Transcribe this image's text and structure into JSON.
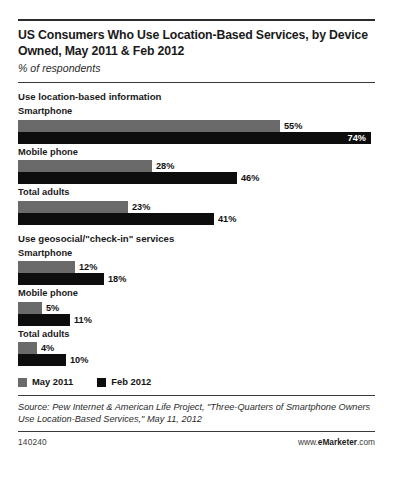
{
  "title": "US Consumers Who Use Location-Based Services, by Device Owned, May 2011 & Feb 2012",
  "subtitle": "% of respondents",
  "legend": {
    "series1": "May 2011",
    "series2": "Feb 2012"
  },
  "source": "Source: Pew Internet & American Life Project, \"Three-Quarters of Smartphone Owners Use Location-Based Services,\" May 11, 2012",
  "footer": {
    "id": "140240",
    "brand_prefix": "www.",
    "brand_name": "eMarketer",
    "brand_suffix": ".com"
  },
  "sections": [
    {
      "heading": "Use location-based information",
      "groups": [
        {
          "label": "Smartphone",
          "may_2011": "55%",
          "feb_2012": "74%"
        },
        {
          "label": "Mobile phone",
          "may_2011": "28%",
          "feb_2012": "46%"
        },
        {
          "label": "Total adults",
          "may_2011": "23%",
          "feb_2012": "41%"
        }
      ]
    },
    {
      "heading": "Use geosocial/\"check-in\" services",
      "groups": [
        {
          "label": "Smartphone",
          "may_2011": "12%",
          "feb_2012": "18%"
        },
        {
          "label": "Mobile phone",
          "may_2011": "5%",
          "feb_2012": "11%"
        },
        {
          "label": "Total adults",
          "may_2011": "4%",
          "feb_2012": "10%"
        }
      ]
    }
  ],
  "chart_data": {
    "type": "bar",
    "title": "US Consumers Who Use Location-Based Services, by Device Owned, May 2011 & Feb 2012",
    "subtitle": "% of respondents",
    "orientation": "horizontal",
    "xlabel": "% of respondents",
    "ylabel": "",
    "xlim": [
      0,
      74
    ],
    "grid": false,
    "legend_position": "bottom-left",
    "colors": {
      "May 2011": "#6a6a6a",
      "Feb 2012": "#0d0d0d"
    },
    "groups": [
      "Use location-based information / Smartphone",
      "Use location-based information / Mobile phone",
      "Use location-based information / Total adults",
      "Use geosocial/\"check-in\" services / Smartphone",
      "Use geosocial/\"check-in\" services / Mobile phone",
      "Use geosocial/\"check-in\" services / Total adults"
    ],
    "categories": [
      "Smartphone",
      "Mobile phone",
      "Total adults",
      "Smartphone",
      "Mobile phone",
      "Total adults"
    ],
    "series": [
      {
        "name": "May 2011",
        "values": [
          55,
          28,
          23,
          12,
          5,
          4
        ]
      },
      {
        "name": "Feb 2012",
        "values": [
          74,
          46,
          41,
          18,
          11,
          10
        ]
      }
    ],
    "annotations": [
      "Use location-based information",
      "Use geosocial/\"check-in\" services"
    ],
    "source": "Source: Pew Internet & American Life Project, \"Three-Quarters of Smartphone Owners Use Location-Based Services,\" May 11, 2012"
  }
}
